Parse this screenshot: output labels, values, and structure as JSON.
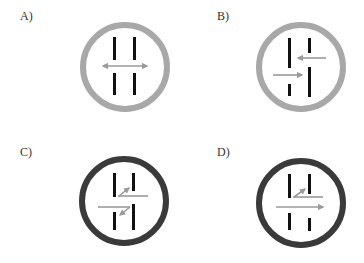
{
  "panels": [
    {
      "id": "A",
      "label": "A)",
      "ring_color": "#a8a8a8",
      "description": "Light grey ring; two parallel vertical bars split into aligned upper and lower halves; double-headed horizontal arrow in the gap between halves."
    },
    {
      "id": "B",
      "label": "B)",
      "ring_color": "#a8a8a8",
      "description": "Light grey ring; staggered bars with offset gaps; upper arrow points left, lower arrow points right."
    },
    {
      "id": "C",
      "label": "C)",
      "ring_color": "#3a3a3a",
      "description": "Dark ring; staggered bars; upper horizontal line with diagonal arrow pointing up-right, lower horizontal line with diagonal arrow pointing down-left."
    },
    {
      "id": "D",
      "label": "D)",
      "ring_color": "#3a3a3a",
      "description": "Dark ring; staggered bars; upper horizontal line with short diagonal arrow pointing up-right, longer horizontal arrow pointing right."
    }
  ],
  "colors": {
    "bar": "#111111",
    "arrow": "#9a9a9a",
    "light_ring": "#a8a8a8",
    "dark_ring": "#3a3a3a",
    "label": "#333333"
  }
}
